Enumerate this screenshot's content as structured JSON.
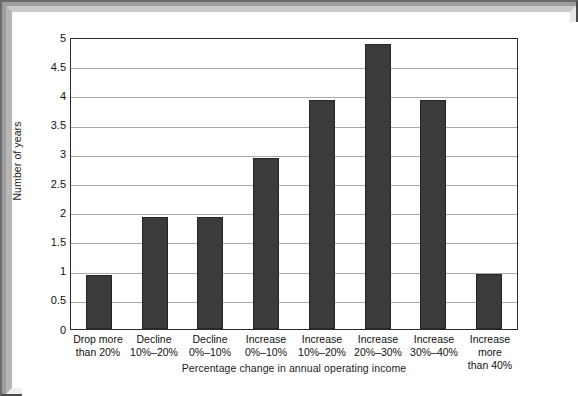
{
  "chart_data": {
    "type": "bar",
    "title": "",
    "xlabel": "Percentage change in annual operating income",
    "ylabel": "Number of years",
    "ylim": [
      0,
      5
    ],
    "ytick_step": 0.5,
    "grid": true,
    "legend": "none",
    "bar_color": "#3b3b3b",
    "plot_border_color": "#2b2b2b",
    "gridline_color": "#a9a9a9",
    "background_color": "#ffffff",
    "frame_color": "#9d9d9d",
    "categories": [
      "Drop more\nthan 20%",
      "Decline\n10%–20%",
      "Decline\n0%–10%",
      "Increase\n0%–10%",
      "Increase\n10%–20%",
      "Increase\n20%–30%",
      "Increase\n30%–40%",
      "Increase more\nthan 40%"
    ],
    "values": [
      0.93,
      1.92,
      1.92,
      2.93,
      3.93,
      4.88,
      3.93,
      0.95
    ],
    "ytick_labels": [
      "5",
      "4.5",
      "4",
      "3.5",
      "3",
      "2.5",
      "2",
      "1.5",
      "1",
      "0.5",
      "0"
    ],
    "ytick_values": [
      5,
      4.5,
      4,
      3.5,
      3,
      2.5,
      2,
      1.5,
      1,
      0.5,
      0
    ]
  }
}
